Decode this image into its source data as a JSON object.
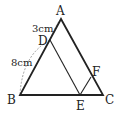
{
  "diagram": {
    "type": "geometry-triangle",
    "points": {
      "A": {
        "label": "A",
        "x": 61,
        "y": 18
      },
      "B": {
        "label": "B",
        "x": 20,
        "y": 95
      },
      "C": {
        "label": "C",
        "x": 103,
        "y": 95
      },
      "D": {
        "label": "D",
        "x": 50,
        "y": 40
      },
      "E": {
        "label": "E",
        "x": 80,
        "y": 95
      },
      "F": {
        "label": "F",
        "x": 91,
        "y": 78
      }
    },
    "measurements": {
      "AD": "3cm",
      "DB": "8cm"
    },
    "colors": {
      "stroke": "#222222",
      "dashed": "#777777"
    }
  }
}
